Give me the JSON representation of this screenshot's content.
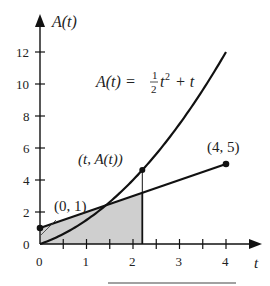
{
  "chart_data": {
    "type": "line",
    "title": "",
    "xlabel": "t",
    "ylabel": "A(t)",
    "xlim": [
      0,
      4.4
    ],
    "ylim": [
      0,
      13.5
    ],
    "grid": false,
    "x_ticks": [
      0,
      0.5,
      1,
      1.5,
      2,
      2.5,
      3,
      3.5,
      4
    ],
    "x_tick_labels": [
      "0",
      "1",
      "2",
      "3",
      "4"
    ],
    "x_tick_label_values": [
      0,
      1,
      2,
      3,
      4
    ],
    "y_ticks": [
      0,
      2,
      4,
      6,
      8,
      10,
      12
    ],
    "y_tick_labels": [
      "0",
      "2",
      "4",
      "6",
      "8",
      "10",
      "12"
    ],
    "series": [
      {
        "name": "A(t) = 1/2 t^2 + t",
        "kind": "curve",
        "formula": "0.5*t^2 + t",
        "x": [
          0,
          0.5,
          1,
          1.5,
          2,
          2.5,
          3,
          3.5,
          4
        ],
        "values": [
          0,
          0.625,
          1.5,
          2.625,
          4,
          5.625,
          7.5,
          9.625,
          12
        ]
      },
      {
        "name": "line from (0, 1) to (4, 5)",
        "kind": "line",
        "formula": "t + 1",
        "x": [
          0,
          4
        ],
        "values": [
          1,
          5
        ]
      }
    ],
    "shaded_region": {
      "description": "area under y = t + 1 from 0 to t",
      "from": 0,
      "to": 2.2,
      "color": "#cfcfcf"
    },
    "vertical_marker": {
      "t": 2.2,
      "value": 4.62
    },
    "annotations": [
      {
        "text": "A(t) = ",
        "frac_num": "1",
        "frac_den": "2",
        "tail": "t",
        "exp": "2",
        "rest": " + t"
      },
      {
        "text": "(t, A(t))",
        "x": 2.2,
        "y": 4.62
      },
      {
        "text": "(0, 1)",
        "x": 0,
        "y": 1
      },
      {
        "text": "(4, 5)",
        "x": 4,
        "y": 5
      }
    ]
  },
  "labels": {
    "y_axis": "A(t)",
    "x_axis": "t",
    "formula_lhs": "A(t) = ",
    "formula_num": "1",
    "formula_den": "2",
    "formula_var": "t",
    "formula_exp": "2",
    "formula_rest": " + t",
    "point_tA": "(t, A(t))",
    "point_01": "(0, 1)",
    "point_45": "(4, 5)"
  },
  "colors": {
    "ink": "#111111",
    "shade": "#cfcfcf"
  }
}
